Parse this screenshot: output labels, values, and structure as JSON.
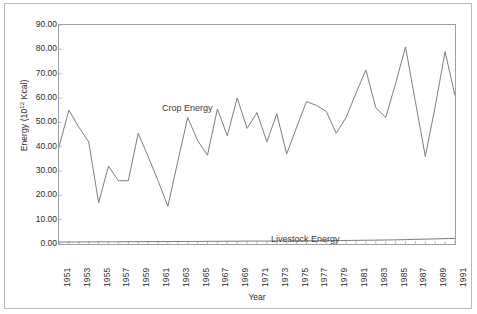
{
  "figure": {
    "xlabel": "Year",
    "ylabel_prefix": "Energy (10",
    "ylabel_exp": "12",
    "ylabel_suffix": " Kcal)"
  },
  "chart_data": {
    "type": "line",
    "title": "",
    "xlabel": "Year",
    "ylabel": "Energy (10^12 Kcal)",
    "xlim": [
      1951,
      1991
    ],
    "ylim": [
      0,
      90
    ],
    "ytick_labels": [
      "90.00",
      "80.00",
      "70.00",
      "60.00",
      "50.00",
      "40.00",
      "30.00",
      "20.00",
      "10.00",
      "0.00"
    ],
    "ytick_values": [
      90,
      80,
      70,
      60,
      50,
      40,
      30,
      20,
      10,
      0
    ],
    "xtick_labels": [
      "1951",
      "1953",
      "1955",
      "1957",
      "1959",
      "1961",
      "1963",
      "1965",
      "1967",
      "1969",
      "1971",
      "1973",
      "1975",
      "1977",
      "1979",
      "1981",
      "1983",
      "1985",
      "1987",
      "1989",
      "1991"
    ],
    "xtick_values": [
      1951,
      1953,
      1955,
      1957,
      1959,
      1961,
      1963,
      1965,
      1967,
      1969,
      1971,
      1973,
      1975,
      1977,
      1979,
      1981,
      1983,
      1985,
      1987,
      1989,
      1991
    ],
    "grid": false,
    "legend_position": "inline-annotation",
    "x": [
      1951,
      1952,
      1953,
      1954,
      1955,
      1956,
      1957,
      1958,
      1959,
      1960,
      1961,
      1962,
      1963,
      1964,
      1965,
      1966,
      1967,
      1968,
      1969,
      1970,
      1971,
      1972,
      1973,
      1974,
      1975,
      1976,
      1977,
      1978,
      1979,
      1980,
      1981,
      1982,
      1983,
      1984,
      1985,
      1986,
      1987,
      1988,
      1989,
      1990,
      1991
    ],
    "series": [
      {
        "name": "Crop Energy",
        "color": "#6e6e6e",
        "values": [
          40.0,
          55.0,
          48.0,
          42.0,
          17.0,
          32.0,
          26.0,
          26.0,
          45.5,
          36.0,
          26.0,
          15.5,
          34.0,
          52.0,
          42.5,
          36.5,
          55.5,
          44.5,
          60.0,
          47.5,
          54.0,
          42.0,
          53.5,
          37.0,
          48.0,
          58.5,
          57.0,
          54.5,
          45.5,
          52.0,
          62.0,
          71.5,
          56.0,
          52.0,
          66.0,
          81.0,
          58.5,
          36.0,
          56.5,
          79.0,
          61.0
        ]
      },
      {
        "name": "Livestock Energy",
        "color": "#6e6e6e",
        "values": [
          0.8,
          0.8,
          0.85,
          0.85,
          0.9,
          0.9,
          0.9,
          0.95,
          0.95,
          1.0,
          1.0,
          1.0,
          1.05,
          1.05,
          1.05,
          1.1,
          1.1,
          1.15,
          1.15,
          1.2,
          1.2,
          1.2,
          1.25,
          1.25,
          1.3,
          1.3,
          1.35,
          1.4,
          1.4,
          1.45,
          1.5,
          1.55,
          1.6,
          1.65,
          1.7,
          1.8,
          1.9,
          2.0,
          2.1,
          2.2,
          2.3
        ]
      }
    ],
    "annotations": [
      {
        "text": "Crop Energy",
        "x": 1956,
        "y": 68
      },
      {
        "text": "Livestock Energy",
        "x": 1974,
        "y": 16
      }
    ]
  }
}
